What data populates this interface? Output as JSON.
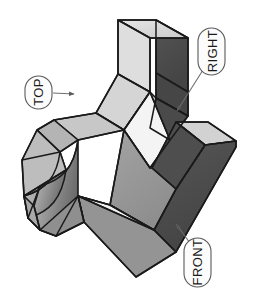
{
  "figure": {
    "type": "isometric-technical-illustration",
    "background_color": "#ffffff",
    "outline_color": "#1a1a1a",
    "callouts": [
      {
        "id": "top",
        "label": "TOP",
        "shape": "stadium",
        "text_rotation_deg": -90,
        "center": {
          "x": 38,
          "y": 92
        },
        "size": {
          "width": 27,
          "height": 33
        },
        "leader": {
          "from_x": 53,
          "from_y": 93,
          "to_x": 76,
          "to_y": 94,
          "arrowhead": true
        }
      },
      {
        "id": "right",
        "label": "RIGHT",
        "shape": "stadium",
        "text_rotation_deg": -90,
        "center": {
          "x": 212,
          "y": 51
        },
        "size": {
          "width": 27,
          "height": 47
        },
        "leader": {
          "from_x": 203,
          "from_y": 70,
          "to_x": 175,
          "to_y": 113,
          "arrowhead": true
        }
      },
      {
        "id": "front",
        "label": "FRONT",
        "shape": "stadium",
        "text_rotation_deg": -90,
        "center": {
          "x": 197,
          "y": 262
        },
        "size": {
          "width": 27,
          "height": 49
        },
        "leader": {
          "from_x": 189,
          "from_y": 242,
          "to_x": 174,
          "to_y": 222,
          "arrowhead": true
        }
      }
    ],
    "palette": {
      "top_face_light": "#d7d7d7",
      "top_face_lighter": "#e3e3e3",
      "front_face_mid": "#9a9a9a",
      "front_face_mid_dark": "#8c8c8c",
      "right_face_dark": "#4c4c4c",
      "right_face_darker": "#3f3f3f",
      "highlight_white": "#f2f2f2",
      "concave_gradient_start": "#b9b9b9",
      "concave_gradient_end": "#6d6d6d",
      "callout_fill": "#fbfbfb",
      "callout_stroke": "#555555",
      "leader_stroke": "#777777"
    },
    "faces": [
      {
        "name": "upper-top-plateau",
        "tone": "top_face_lighter"
      },
      {
        "name": "upper-right-wall",
        "tone": "right_face_dark"
      },
      {
        "name": "upper-front-wall",
        "tone": "front_face_mid"
      },
      {
        "name": "step-top-shelf",
        "tone": "top_face_light"
      },
      {
        "name": "inner-notch-wall",
        "tone": "right_face_darker"
      },
      {
        "name": "slanted-rib-top",
        "tone": "highlight_white"
      },
      {
        "name": "lower-front-face",
        "tone": "front_face_mid_dark"
      },
      {
        "name": "right-arm-top",
        "tone": "top_face_light"
      },
      {
        "name": "right-arm-front",
        "tone": "right_face_dark"
      },
      {
        "name": "left-fillet-concave",
        "tone": "concave_gradient"
      },
      {
        "name": "left-end-cap",
        "tone": "front_face_mid"
      },
      {
        "name": "bottom-wedge",
        "tone": "front_face_mid"
      }
    ]
  }
}
